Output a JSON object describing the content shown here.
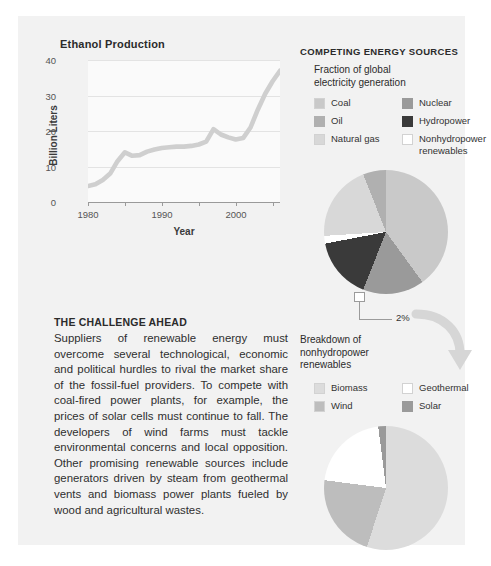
{
  "chart_data": [
    {
      "type": "line",
      "title": "Ethanol Production",
      "xlabel": "Year",
      "ylabel": "Billion Liters",
      "xlim": [
        1980,
        2006
      ],
      "ylim": [
        0,
        40
      ],
      "yticks": [
        0,
        10,
        20,
        30,
        40
      ],
      "xticks": [
        1980,
        1990,
        2000
      ],
      "xminorticks": [
        1985,
        1995,
        2005
      ],
      "grid": true,
      "line_color": "#cfcfcf",
      "x": [
        1980,
        1981,
        1982,
        1983,
        1984,
        1985,
        1986,
        1987,
        1988,
        1989,
        1990,
        1991,
        1992,
        1993,
        1994,
        1995,
        1996,
        1997,
        1998,
        1999,
        2000,
        2001,
        2002,
        2003,
        2004,
        2005,
        2006
      ],
      "values": [
        4.5,
        5.0,
        6.2,
        8.0,
        11.5,
        14.0,
        13.0,
        13.2,
        14.2,
        14.8,
        15.2,
        15.4,
        15.6,
        15.6,
        15.8,
        16.2,
        17.0,
        20.5,
        19.0,
        18.2,
        17.6,
        18.0,
        21.0,
        26.0,
        30.5,
        34.0,
        37.0
      ]
    },
    {
      "type": "pie",
      "title": "Fraction of global electricity generation",
      "categories": [
        "Coal",
        "Nuclear",
        "Hydropower",
        "Nonhydropower renewables",
        "Natural gas",
        "Oil"
      ],
      "values": [
        40,
        16,
        16,
        2,
        20,
        6
      ],
      "colors": [
        "#c9c9c9",
        "#9a9a9a",
        "#3a3a3a",
        "#ffffff",
        "#d8d8d8",
        "#b0b0b0"
      ]
    },
    {
      "type": "pie",
      "title": "Breakdown of nonhydropower renewables",
      "categories": [
        "Biomass",
        "Wind",
        "Geothermal",
        "Solar"
      ],
      "values": [
        55,
        22,
        21,
        2
      ],
      "colors": [
        "#dcdcdc",
        "#bdbdbd",
        "#ffffff",
        "#9a9a9a"
      ]
    }
  ],
  "linechart": {
    "title": "Ethanol Production",
    "ylabel": "Billion Liters",
    "xlabel": "Year",
    "ytick_labels": [
      "40",
      "30",
      "20",
      "10",
      "0"
    ],
    "xtick_labels": [
      "1980",
      "1990",
      "2000"
    ]
  },
  "energy": {
    "section_title": "COMPETING ENERGY SOURCES",
    "subtitle": "Fraction of global\nelectricity generation",
    "legend": [
      {
        "label": "Coal",
        "color": "#c9c9c9"
      },
      {
        "label": "Nuclear",
        "color": "#9a9a9a"
      },
      {
        "label": "Oil",
        "color": "#b0b0b0"
      },
      {
        "label": "Hydropower",
        "color": "#3a3a3a"
      },
      {
        "label": "Natural gas",
        "color": "#d8d8d8"
      },
      {
        "label": "Nonhydropower\nrenewables",
        "color": "#ffffff"
      }
    ]
  },
  "callout": {
    "percent": "2%"
  },
  "renewables": {
    "subtitle": "Breakdown of\nnonhydropower\nrenewables",
    "legend": [
      {
        "label": "Biomass",
        "color": "#dcdcdc"
      },
      {
        "label": "Geothermal",
        "color": "#ffffff"
      },
      {
        "label": "Wind",
        "color": "#bdbdbd"
      },
      {
        "label": "Solar",
        "color": "#9a9a9a"
      }
    ]
  },
  "article": {
    "heading": "THE CHALLENGE AHEAD",
    "body": "Suppliers of renewable energy must overcome several technological, economic and political hurdles to rival the market share of the fossil-fuel providers. To compete with coal-fired power plants, for example, the prices of solar cells must continue to fall. The developers of wind farms must tackle environmental concerns and local opposition. Other promising renewable sources include generators driven by steam from geothermal vents and biomass power plants fueled by wood and agricultural wastes."
  }
}
